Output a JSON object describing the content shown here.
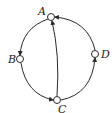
{
  "diagram": {
    "type": "directed-graph",
    "nodes": [
      {
        "id": "A",
        "label": "A"
      },
      {
        "id": "B",
        "label": "B"
      },
      {
        "id": "C",
        "label": "C"
      },
      {
        "id": "D",
        "label": "D"
      }
    ],
    "edges": [
      {
        "from": "A",
        "to": "B",
        "shape": "arc-left-upper"
      },
      {
        "from": "B",
        "to": "C",
        "shape": "arc-left-lower"
      },
      {
        "from": "C",
        "to": "D",
        "shape": "arc-right-lower"
      },
      {
        "from": "D",
        "to": "A",
        "shape": "arc-right-upper"
      },
      {
        "from": "C",
        "to": "A",
        "shape": "chord"
      }
    ],
    "colors": {
      "stroke": "#2a2a2a",
      "node_fill": "#ffffff",
      "background": "#ffffff"
    }
  }
}
